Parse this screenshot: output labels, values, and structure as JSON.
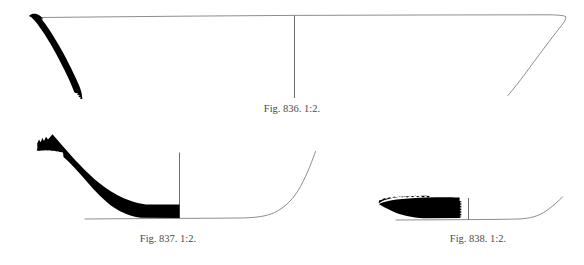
{
  "plate": {
    "kind": "archaeological-pottery-profile-plate",
    "background_color": "#ffffff",
    "line_color": "#8d8d8d",
    "axis_color": "#6f6f6f",
    "section_fill_color": "#000000",
    "caption_color": "#4a4a4a",
    "width": 584,
    "height": 265
  },
  "figures": [
    {
      "id": "836",
      "caption": "Fig. 836. 1:2.",
      "label": "Fig. 836.",
      "scale": "1:2.",
      "description": "Wide shallow open bowl profile; preserved rim-and-wall sherd drawn solid black at left, reconstructed rim line and right wall in thin outline, central vertical axis.",
      "preserved_side": "left",
      "vertical_axis_x": 294
    },
    {
      "id": "837",
      "caption": "Fig. 837. 1:2.",
      "label": "Fig. 837.",
      "scale": "1:2.",
      "description": "Flat-based dish profile; thick solid black sherd section at left with jagged break edge, reconstructed base and rising wall in thin outline to the right, vertical axis at the break.",
      "preserved_side": "left",
      "vertical_axis_x": 179
    },
    {
      "id": "838",
      "caption": "Fig. 838. 1:2.",
      "label": "Fig. 838.",
      "scale": "1:2.",
      "description": "Small flat-based dish profile; short solid black sherd section at left with jagged break edges, reconstructed base and rising wall in thin outline to the right, vertical axis right of the break.",
      "preserved_side": "left",
      "vertical_axis_x": 468
    }
  ]
}
